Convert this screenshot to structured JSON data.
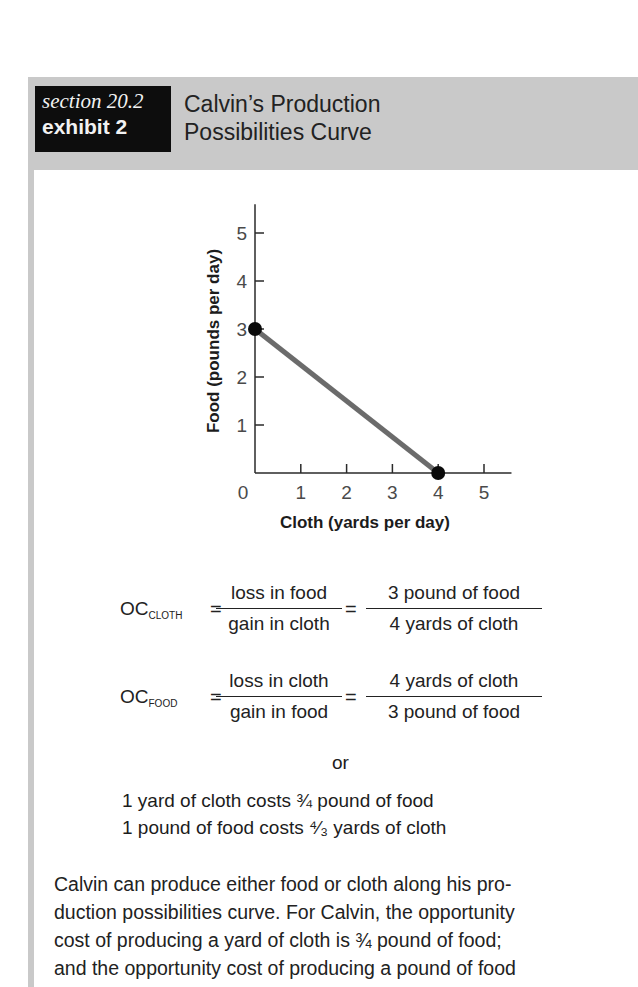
{
  "header": {
    "section_label": "section 20.2",
    "exhibit_label": "exhibit 2",
    "title_line1": "Calvin’s Production",
    "title_line2": "Possibilities Curve"
  },
  "chart_data": {
    "type": "line",
    "title": "Calvin’s Production Possibilities Curve",
    "xlabel": "Cloth (yards per day)",
    "ylabel": "Food (pounds per day)",
    "x_ticks": [
      "0",
      "1",
      "2",
      "3",
      "4",
      "5"
    ],
    "y_ticks": [
      "1",
      "2",
      "3",
      "4",
      "5"
    ],
    "xlim": [
      0,
      5.6
    ],
    "ylim": [
      0,
      5.6
    ],
    "grid": false,
    "series": [
      {
        "name": "Production Possibilities Curve",
        "x": [
          0,
          4
        ],
        "y": [
          3,
          0
        ],
        "color": "#6b6b6b"
      }
    ],
    "points": [
      {
        "x": 0,
        "y": 3
      },
      {
        "x": 4,
        "y": 0
      }
    ]
  },
  "equations": {
    "oc_cloth": {
      "label": "OC",
      "subscript": "CLOTH",
      "frac1_num": "loss in food",
      "frac1_den": "gain in cloth",
      "frac2_num": "3 pound of food",
      "frac2_den": "4 yards of cloth"
    },
    "oc_food": {
      "label": "OC",
      "subscript": "FOOD",
      "frac1_num": "loss in cloth",
      "frac1_den": "gain in food",
      "frac2_num": "4 yards of cloth",
      "frac2_den": "3 pound of food"
    },
    "equals": "=",
    "or": "or",
    "statement1": "1 yard of cloth costs ¾ pound of food",
    "statement2": "1 pound of food costs ⁴⁄₃ yards of cloth"
  },
  "paragraph": {
    "line1": "Calvin can produce either food or cloth along his pro-",
    "line2": "duction possibilities curve. For Calvin, the opportunity",
    "line3": "cost of producing a yard of cloth is ¾ pound of food;",
    "line4": "and the opportunity cost of producing a pound of food"
  }
}
